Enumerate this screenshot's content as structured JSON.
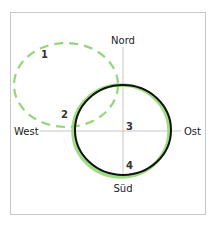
{
  "diagram": {
    "directions": {
      "north": "Nord",
      "south": "Süd",
      "west": "West",
      "east": "Ost"
    },
    "markers": [
      {
        "label": "1"
      },
      {
        "label": "2"
      },
      {
        "label": "3"
      },
      {
        "label": "4"
      }
    ],
    "colors": {
      "frame": "#c8c8c8",
      "axis": "#b0b0b0",
      "circle": "#111111",
      "green": "#7fcf5c",
      "dashed": "#93d77a"
    }
  }
}
